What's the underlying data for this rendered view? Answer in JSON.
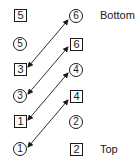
{
  "labels": {
    "bottom": "Bottom",
    "top": "Top"
  },
  "left_column": [
    {
      "shape": "box",
      "value": "5"
    },
    {
      "shape": "circle",
      "value": "5"
    },
    {
      "shape": "box",
      "value": "3"
    },
    {
      "shape": "circle",
      "value": "3"
    },
    {
      "shape": "box",
      "value": "1"
    },
    {
      "shape": "circle",
      "value": "1"
    }
  ],
  "right_column": [
    {
      "shape": "circle",
      "value": "6"
    },
    {
      "shape": "box",
      "value": "6"
    },
    {
      "shape": "circle",
      "value": "4"
    },
    {
      "shape": "box",
      "value": "4"
    },
    {
      "shape": "circle",
      "value": "2"
    },
    {
      "shape": "box",
      "value": "2"
    }
  ],
  "connections": [
    {
      "from": "box 3",
      "to": "circle 6",
      "type": "double-arrow"
    },
    {
      "from": "circle 3",
      "to": "box 6",
      "type": "double-arrow"
    },
    {
      "from": "box 1",
      "to": "circle 4",
      "type": "double-arrow"
    },
    {
      "from": "circle 1",
      "to": "box 4",
      "type": "double-arrow"
    }
  ],
  "colors": {
    "ink": "#1a1a1a",
    "background": "#ffffff"
  }
}
